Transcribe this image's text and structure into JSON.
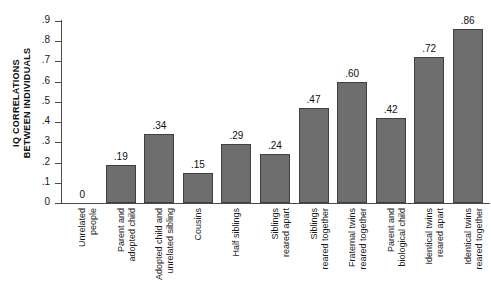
{
  "chart_data": {
    "type": "bar",
    "title": "",
    "xlabel": "",
    "ylabel": "IQ CORRELATIONS\nBETWEEN INDIVIDUALS",
    "ylim": [
      0,
      0.9
    ],
    "grid": false,
    "legend": "none",
    "ytick_labels": [
      ".9",
      ".8",
      ".7",
      ".6",
      ".5",
      ".4",
      ".3",
      ".2",
      ".1",
      "0"
    ],
    "ytick_values": [
      0.9,
      0.8,
      0.7,
      0.6,
      0.5,
      0.4,
      0.3,
      0.2,
      0.1,
      0.0
    ],
    "bar_color": "#6e6e6e",
    "bar_edge_color": "#404040",
    "axis_color": "#4a4a4a",
    "categories": [
      "Unrelated\npeople",
      "Parent and\nadopted child",
      "Adopted child and\nunrelated sibling",
      "Cousins",
      "Half siblings",
      "Siblings\nreared apart",
      "Siblings\nreared together",
      "Fraternal twins\nreared together",
      "Parent and\nbiological child",
      "Identical twins\nreared apart",
      "Identical twins\nreared together"
    ],
    "values": [
      0.0,
      0.19,
      0.34,
      0.15,
      0.29,
      0.24,
      0.47,
      0.6,
      0.42,
      0.72,
      0.86
    ],
    "value_labels": [
      "0",
      ".19",
      ".34",
      ".15",
      ".29",
      ".24",
      ".47",
      ".60",
      ".42",
      ".72",
      ".86"
    ]
  }
}
